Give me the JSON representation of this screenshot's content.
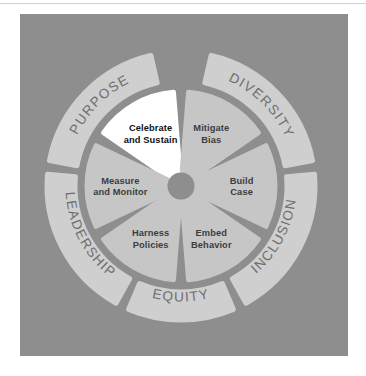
{
  "diagram": {
    "center": {
      "cx": 161,
      "cy": 172
    },
    "colors": {
      "panel_background": "#8e8e8e",
      "ring_fill": "#cfcfcf",
      "segment_fill": "#c6c6c6",
      "segment_highlight_fill": "#ffffff",
      "ring_text": "#6e6e6e",
      "segment_text": "#3d3d3d",
      "segment_highlight_text": "#111111",
      "top_rule": "#d2d2d2"
    },
    "outer_ring": {
      "inner_radius": 106,
      "outer_radius": 134,
      "segment_count": 5,
      "labels": [
        {
          "id": "purpose",
          "text": "PURPOSE",
          "start_deg": 281,
          "end_deg": 347,
          "text_mid_deg": 315
        },
        {
          "id": "diversity",
          "text": "DIVERSITY",
          "start_deg": 13,
          "end_deg": 79,
          "text_mid_deg": 45
        },
        {
          "id": "inclusion",
          "text": "INCLUSION",
          "start_deg": 85,
          "end_deg": 151,
          "text_mid_deg": 118
        },
        {
          "id": "equity",
          "text": "EQUITY",
          "start_deg": 157,
          "end_deg": 203,
          "text_mid_deg": 180
        },
        {
          "id": "leadership",
          "text": "LEADERSHIP",
          "start_deg": 209,
          "end_deg": 275,
          "text_mid_deg": 242
        }
      ]
    },
    "inner_wheel": {
      "radius": 94,
      "hub_radius": 13,
      "segment_count": 6,
      "segments": [
        {
          "id": "celebrate-and-sustain",
          "lines": [
            "Celebrate",
            "and Sustain"
          ],
          "start_deg": 300,
          "end_deg": 360,
          "highlighted": true
        },
        {
          "id": "mitigate-bias",
          "lines": [
            "Mitigate",
            "Bias"
          ],
          "start_deg": 0,
          "end_deg": 60,
          "highlighted": false
        },
        {
          "id": "build-case",
          "lines": [
            "Build",
            "Case"
          ],
          "start_deg": 60,
          "end_deg": 120,
          "highlighted": false
        },
        {
          "id": "embed-behavior",
          "lines": [
            "Embed",
            "Behavior"
          ],
          "start_deg": 120,
          "end_deg": 180,
          "highlighted": false
        },
        {
          "id": "harness-policies",
          "lines": [
            "Harness",
            "Policies"
          ],
          "start_deg": 180,
          "end_deg": 240,
          "highlighted": false
        },
        {
          "id": "measure-and-monitor",
          "lines": [
            "Measure",
            "and Monitor"
          ],
          "start_deg": 240,
          "end_deg": 300,
          "highlighted": false
        }
      ]
    }
  }
}
